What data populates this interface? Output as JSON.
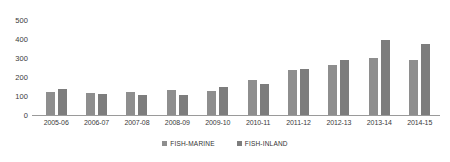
{
  "chart_data": {
    "type": "bar",
    "title": "",
    "subtitle": "",
    "xlabel": "",
    "ylabel": "",
    "ylim": [
      0,
      500
    ],
    "yticks": [
      0,
      100,
      200,
      300,
      400,
      500
    ],
    "grid": false,
    "legend_position": "bottom-center",
    "categories": [
      "2005-06",
      "2006-07",
      "2007-08",
      "2008-09",
      "2009-10",
      "2010-11",
      "2011-12",
      "2012-13",
      "2013-14",
      "2014-15"
    ],
    "series": [
      {
        "name": "FISH-MARINE",
        "color": "#8e8e8e",
        "values": [
          120,
          115,
          120,
          130,
          125,
          185,
          235,
          265,
          300,
          290
        ]
      },
      {
        "name": "FISH-INLAND",
        "color": "#7d7d7d",
        "values": [
          135,
          110,
          105,
          105,
          150,
          165,
          240,
          290,
          395,
          375
        ]
      }
    ]
  },
  "legend": {
    "items": [
      {
        "label": "FISH-MARINE",
        "swatch": "marine-swatch-icon"
      },
      {
        "label": "FISH-INLAND",
        "swatch": "inland-swatch-icon"
      }
    ]
  }
}
